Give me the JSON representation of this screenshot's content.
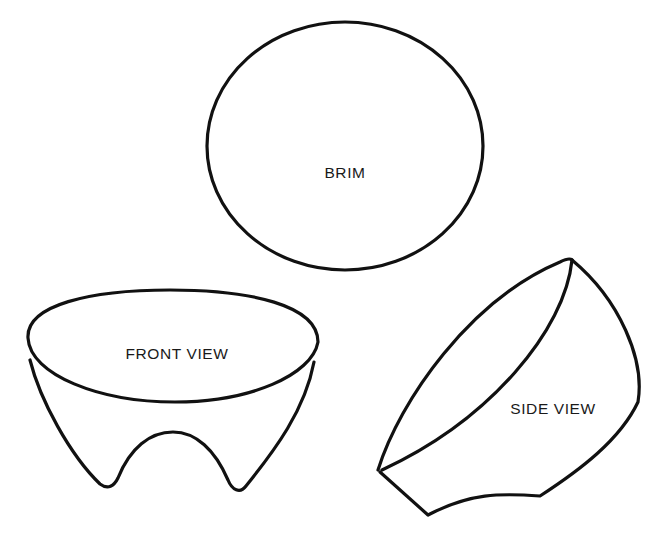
{
  "diagram": {
    "type": "pattern-pieces",
    "shapes": [
      {
        "id": "brim",
        "label": "BRIM"
      },
      {
        "id": "front-view",
        "label": "FRONT VIEW"
      },
      {
        "id": "side-view",
        "label": "SIDE VIEW"
      }
    ],
    "colors": {
      "stroke": "#111111",
      "background": "#ffffff",
      "text": "#1a1a1a"
    }
  }
}
